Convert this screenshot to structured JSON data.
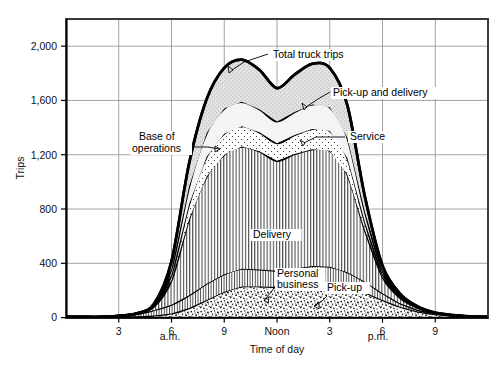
{
  "chart_data": {
    "type": "area",
    "title": "",
    "xlabel": "Time of day",
    "ylabel": "Trips",
    "stacked": true,
    "grid": true,
    "legend_position": "inline-annotations",
    "x": [
      0,
      1,
      2,
      3,
      4,
      5,
      6,
      7,
      8,
      9,
      10,
      11,
      12,
      13,
      14,
      15,
      16,
      17,
      18,
      19,
      20,
      21,
      22,
      23,
      24
    ],
    "x_tick_values": [
      3,
      6,
      9,
      12,
      15,
      18,
      21
    ],
    "x_tick_labels": [
      "3",
      "6",
      "9",
      "Noon",
      "3",
      "6",
      "9"
    ],
    "x_period_labels": [
      "a.m.",
      "p.m."
    ],
    "xlim": [
      0,
      24
    ],
    "ylim": [
      0,
      2200
    ],
    "y_tick_values": [
      0,
      400,
      800,
      1200,
      1600,
      2000
    ],
    "y_tick_labels": [
      "0",
      "400",
      "800",
      "1,200",
      "1,600",
      "2,000"
    ],
    "series": [
      {
        "name": "Personal business",
        "label": "Personal business",
        "fill": "stipple",
        "values": [
          5,
          5,
          5,
          8,
          10,
          15,
          30,
          70,
          130,
          190,
          230,
          230,
          225,
          235,
          250,
          250,
          225,
          185,
          130,
          80,
          45,
          25,
          15,
          8,
          5
        ]
      },
      {
        "name": "Pick-up",
        "label": "Pick-up",
        "fill": "vertical-hatch-fine",
        "values": [
          0,
          0,
          0,
          5,
          15,
          40,
          65,
          95,
          120,
          130,
          130,
          125,
          120,
          125,
          130,
          125,
          110,
          80,
          50,
          25,
          12,
          6,
          3,
          0,
          0
        ]
      },
      {
        "name": "Delivery",
        "label": "Delivery",
        "fill": "vertical-hatch",
        "values": [
          0,
          0,
          0,
          0,
          5,
          25,
          180,
          560,
          790,
          880,
          900,
          870,
          810,
          845,
          860,
          855,
          720,
          380,
          120,
          40,
          15,
          5,
          0,
          0,
          0
        ]
      },
      {
        "name": "Base of operations",
        "label": "Base of operations",
        "fill": "dotted",
        "values": [
          0,
          0,
          0,
          0,
          0,
          10,
          40,
          110,
          145,
          155,
          150,
          140,
          130,
          140,
          150,
          145,
          120,
          60,
          22,
          8,
          3,
          0,
          0,
          0,
          0
        ]
      },
      {
        "name": "Service",
        "label": "Service",
        "fill": "light-gray",
        "values": [
          0,
          0,
          0,
          0,
          0,
          5,
          45,
          130,
          175,
          185,
          180,
          170,
          160,
          170,
          180,
          175,
          150,
          75,
          25,
          10,
          3,
          0,
          0,
          0,
          0
        ]
      },
      {
        "name": "Pick-up and delivery",
        "label": "Pick-up and delivery",
        "fill": "gray-hatch",
        "values": [
          0,
          0,
          0,
          0,
          0,
          5,
          55,
          170,
          250,
          300,
          310,
          290,
          245,
          275,
          300,
          290,
          240,
          110,
          35,
          12,
          4,
          0,
          0,
          0,
          0
        ]
      }
    ],
    "total_series": {
      "name": "Total truck trips",
      "label": "Total truck trips",
      "values": [
        5,
        5,
        5,
        13,
        30,
        100,
        415,
        1135,
        1610,
        1840,
        1900,
        1825,
        1690,
        1790,
        1870,
        1840,
        1565,
        890,
        382,
        175,
        82,
        36,
        18,
        8,
        5
      ]
    },
    "annotations": [
      {
        "text": "Total truck trips",
        "x_px": 273,
        "y_px": 58
      },
      {
        "text": "Pick-up and delivery",
        "x_px": 333,
        "y_px": 96
      },
      {
        "text": "Service",
        "x_px": 350,
        "y_px": 140
      },
      {
        "text": "Base of",
        "x_px": 139,
        "y_px": 140
      },
      {
        "text": "operations",
        "x_px": 132,
        "y_px": 152
      },
      {
        "text": "Delivery",
        "x_px": 253,
        "y_px": 238
      },
      {
        "text": "Personal",
        "x_px": 277,
        "y_px": 277
      },
      {
        "text": "business",
        "x_px": 277,
        "y_px": 288
      },
      {
        "text": "Pick-up",
        "x_px": 327,
        "y_px": 291
      }
    ]
  }
}
